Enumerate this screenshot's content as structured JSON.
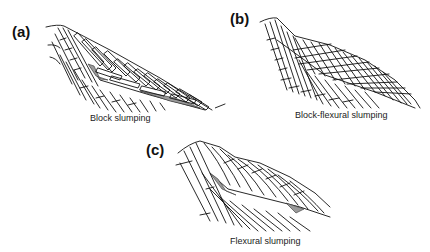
{
  "figure": {
    "panels": [
      {
        "id": "a",
        "letter": "(a)",
        "caption": "Block slumping"
      },
      {
        "id": "b",
        "letter": "(b)",
        "caption": "Block-flexural slumping"
      },
      {
        "id": "c",
        "letter": "(c)",
        "caption": "Flexural slumping"
      }
    ],
    "colors": {
      "line": "#111111",
      "shade": "#9a9a9a",
      "background": "#ffffff"
    }
  }
}
